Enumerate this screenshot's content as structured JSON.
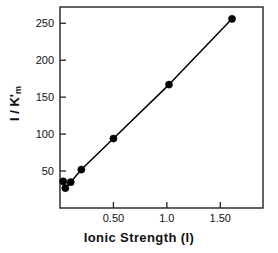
{
  "chart_data": {
    "type": "scatter",
    "title": "",
    "subtitle": "",
    "xlabel": "Ionic Strength (I)",
    "ylabel": "I / K'm",
    "ylabel_main": "I / K",
    "ylabel_sub": "m",
    "ylabel_prime": "'",
    "xlim": [
      0.0,
      1.9
    ],
    "ylim": [
      0,
      272
    ],
    "grid": false,
    "legend": null,
    "marker": "filled-circle",
    "marker_color": "#000000",
    "line_color": "#000000",
    "line_style": "solid",
    "xticks": [
      0.5,
      1.0,
      1.5
    ],
    "xtick_labels": [
      "0.50",
      "1.0",
      "1.50"
    ],
    "yticks": [
      50,
      100,
      150,
      200,
      250
    ],
    "ytick_labels": [
      "50",
      "100",
      "150",
      "200",
      "250"
    ],
    "x": [
      0.03,
      0.05,
      0.1,
      0.2,
      0.5,
      1.02,
      1.61
    ],
    "y": [
      36,
      27,
      35,
      52,
      94,
      167,
      256
    ],
    "points": [
      {
        "x": 0.03,
        "y": 36
      },
      {
        "x": 0.05,
        "y": 27
      },
      {
        "x": 0.1,
        "y": 35
      },
      {
        "x": 0.2,
        "y": 52
      },
      {
        "x": 0.5,
        "y": 94
      },
      {
        "x": 1.02,
        "y": 167
      },
      {
        "x": 1.61,
        "y": 256
      }
    ],
    "frame": {
      "left": 60,
      "right": 263,
      "top": 7,
      "bottom": 208
    }
  }
}
